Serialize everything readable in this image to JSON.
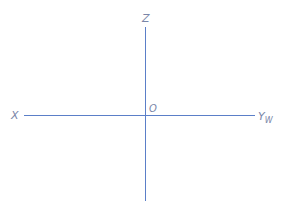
{
  "diagram": {
    "type": "coordinate-axes",
    "axes": {
      "vertical": {
        "label": "Z"
      },
      "horizontal_left": {
        "label": "X"
      },
      "horizontal_right": {
        "label": "Y",
        "subscript": "W"
      }
    },
    "origin": {
      "label": "O"
    },
    "colors": {
      "axis_line": "#5b7fc8",
      "label": "#7a86a8"
    }
  }
}
